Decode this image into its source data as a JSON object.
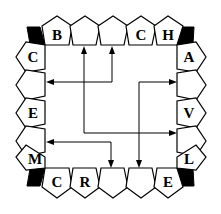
{
  "diagram": {
    "title": "",
    "colors": {
      "stroke": "#000000",
      "corner_fill": "#000000",
      "background": "#ffffff"
    },
    "top_row": [
      "B",
      "",
      "",
      "C",
      "H"
    ],
    "right_column": [
      "A",
      "",
      "V",
      "",
      "L"
    ],
    "bottom_row": [
      "C",
      "R",
      "",
      "",
      "E"
    ],
    "left_column": [
      "C",
      "",
      "E",
      "",
      "M"
    ],
    "corners": [
      "top-left",
      "top-right",
      "bottom-right",
      "bottom-left"
    ],
    "arrows": [
      {
        "from": "left-column-slot-4 (empty)",
        "to": "top-row-slot-2 & right-column-slot-4 via bend",
        "description": "vertical from top slot 2 down, turns right to right slot 4"
      },
      {
        "from": "top-row-slot-3",
        "to": "left-column-slot-2",
        "description": "bidirectional: top slot 3 to left slot 2"
      },
      {
        "from": "right-column-slot-2",
        "to": "bottom-row-slot-4",
        "description": "bidirectional: right slot 2 to bottom slot 4"
      },
      {
        "from": "left-column-slot-4",
        "to": "bottom-row-slot-3",
        "description": "bidirectional: left slot 4 to bottom slot 3"
      }
    ]
  }
}
